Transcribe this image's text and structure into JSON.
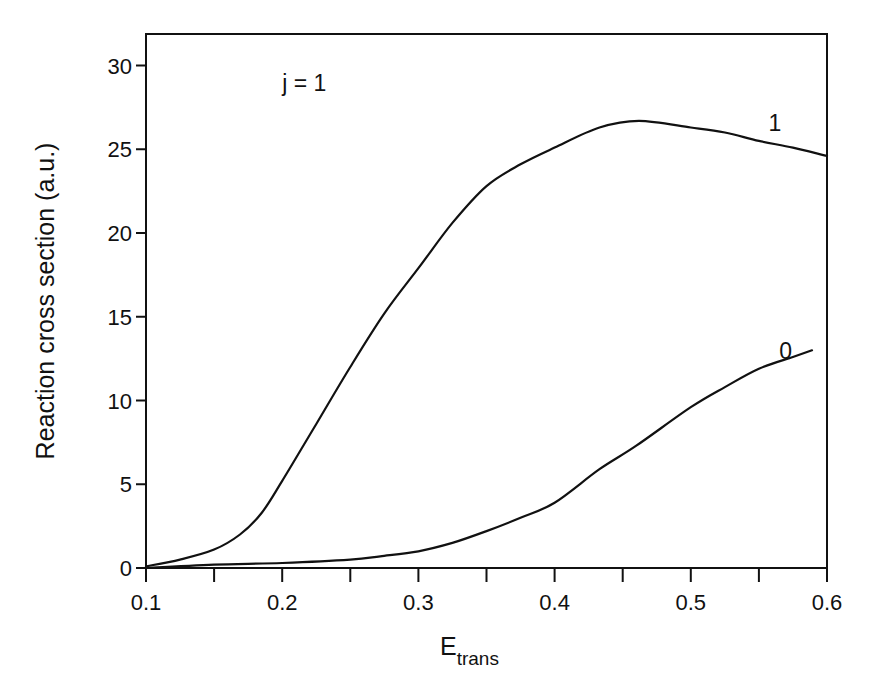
{
  "chart_data": {
    "type": "line",
    "title": "",
    "xlabel": "E_trans",
    "xlabel_main": "E",
    "xlabel_sub": "trans",
    "ylabel": "Reaction cross section (a.u.)",
    "xlim": [
      0.1,
      0.6
    ],
    "ylim": [
      0,
      32
    ],
    "grid": false,
    "legend": "none (curves labeled directly)",
    "xticks": [
      0.1,
      0.2,
      0.3,
      0.4,
      0.5,
      0.6
    ],
    "xtick_labels": [
      "0.1",
      "0.2",
      "0.3",
      "0.4",
      "0.5",
      "0.6"
    ],
    "xminor_ticks": [
      0.15,
      0.25,
      0.35,
      0.45,
      0.55
    ],
    "yticks": [
      0,
      5,
      10,
      15,
      20,
      25,
      30
    ],
    "ytick_labels": [
      "0",
      "5",
      "10",
      "15",
      "20",
      "25",
      "30"
    ],
    "annotations": [
      {
        "text": "j = 1",
        "x": 0.2,
        "y": 28.5
      },
      {
        "text": "1",
        "x": 0.557,
        "y": 26.1
      },
      {
        "text": "0",
        "x": 0.565,
        "y": 12.5
      }
    ],
    "series": [
      {
        "name": "1",
        "x": [
          0.1,
          0.125,
          0.15,
          0.169,
          0.185,
          0.2,
          0.225,
          0.25,
          0.275,
          0.3,
          0.325,
          0.35,
          0.375,
          0.4,
          0.433,
          0.462,
          0.5,
          0.525,
          0.55,
          0.575,
          0.6
        ],
        "y": [
          0.1,
          0.5,
          1.1,
          2.0,
          3.3,
          5.2,
          8.6,
          12.0,
          15.2,
          17.9,
          20.6,
          22.8,
          24.1,
          25.1,
          26.3,
          26.7,
          26.3,
          26.0,
          25.5,
          25.1,
          24.6
        ]
      },
      {
        "name": "0",
        "x": [
          0.1,
          0.15,
          0.2,
          0.25,
          0.272,
          0.3,
          0.325,
          0.35,
          0.375,
          0.4,
          0.433,
          0.46,
          0.5,
          0.525,
          0.55,
          0.575,
          0.589
        ],
        "y": [
          0.0,
          0.2,
          0.3,
          0.5,
          0.7,
          1.0,
          1.5,
          2.2,
          3.0,
          3.9,
          5.9,
          7.3,
          9.6,
          10.8,
          11.9,
          12.6,
          13.0
        ]
      }
    ]
  }
}
